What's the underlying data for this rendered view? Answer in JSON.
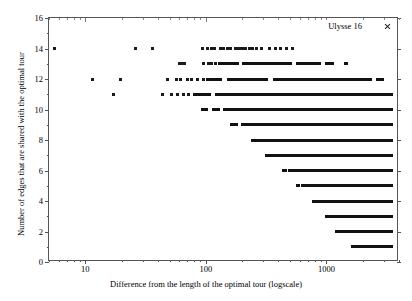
{
  "chart_data": {
    "type": "scatter",
    "title": "",
    "xlabel": "Difference from the length of the optimal tour (logscale)",
    "ylabel": "Number of edges that are shared with the optimal tour",
    "legend": [
      {
        "name": "Ulysse 16",
        "marker": "cross-marker"
      }
    ],
    "legend_position": "top-right",
    "grid": false,
    "xscale": "log",
    "xlim": [
      5,
      4000
    ],
    "ylim": [
      0,
      16
    ],
    "xticks": [
      10,
      100,
      1000
    ],
    "xtick_labels": [
      "10",
      "100",
      "1000"
    ],
    "yticks": [
      0,
      2,
      4,
      6,
      8,
      10,
      12,
      14,
      16
    ],
    "ytick_labels": [
      "0",
      "2",
      "4",
      "6",
      "8",
      "10",
      "12",
      "14",
      "16"
    ],
    "series_name": "Ulysse 16",
    "rows": [
      {
        "y": 14,
        "points": [
          5.6,
          26,
          36,
          94,
          104,
          112,
          118,
          132,
          140,
          152,
          160,
          175,
          182,
          195,
          205,
          215,
          230,
          245,
          262,
          290,
          340,
          380,
          420,
          470,
          520
        ],
        "bands": []
      },
      {
        "y": 13,
        "points": [
          60,
          63,
          67,
          95,
          105,
          112,
          120
        ],
        "bands": [
          [
            125,
            190
          ],
          [
            200,
            520
          ],
          [
            560,
            900
          ],
          [
            980,
            1150
          ],
          [
            1400,
            1500
          ]
        ]
      },
      {
        "y": 12,
        "points": [
          11.5,
          19.5,
          48,
          57,
          62,
          70,
          76,
          86,
          95
        ],
        "bands": [
          [
            100,
            135
          ],
          [
            150,
            330
          ],
          [
            360,
            2400
          ],
          [
            2600,
            3000
          ]
        ]
      },
      {
        "y": 11,
        "points": [
          17,
          44,
          52,
          58,
          65,
          72
        ],
        "bands": [
          [
            78,
            110
          ],
          [
            120,
            3600
          ]
        ]
      },
      {
        "y": 10,
        "points": [],
        "bands": [
          [
            92,
            104
          ],
          [
            112,
            130
          ],
          [
            140,
            3600
          ]
        ]
      },
      {
        "y": 9,
        "points": [],
        "bands": [
          [
            160,
            185
          ],
          [
            195,
            3600
          ]
        ]
      },
      {
        "y": 8,
        "points": [],
        "bands": [
          [
            235,
            3600
          ]
        ]
      },
      {
        "y": 7,
        "points": [],
        "bands": [
          [
            310,
            3600
          ]
        ]
      },
      {
        "y": 6,
        "points": [],
        "bands": [
          [
            430,
            470
          ],
          [
            480,
            3600
          ]
        ]
      },
      {
        "y": 5,
        "points": [],
        "bands": [
          [
            560,
            600
          ],
          [
            620,
            3600
          ]
        ]
      },
      {
        "y": 4,
        "points": [],
        "bands": [
          [
            760,
            3600
          ]
        ]
      },
      {
        "y": 3,
        "points": [],
        "bands": [
          [
            980,
            3600
          ]
        ]
      },
      {
        "y": 2,
        "points": [],
        "bands": [
          [
            1180,
            3600
          ]
        ]
      },
      {
        "y": 1,
        "points": [],
        "bands": [
          [
            1600,
            3600
          ]
        ]
      },
      {
        "y": 0,
        "points": [],
        "bands": [
          [
            2400,
            3600
          ]
        ]
      }
    ]
  }
}
